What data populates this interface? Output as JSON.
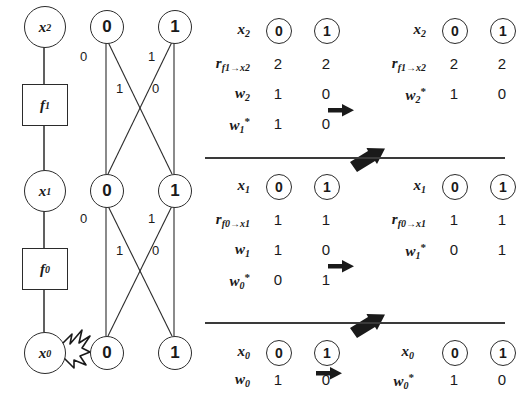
{
  "figure": {
    "factor_graph": {
      "nodes": [
        {
          "id": "x2",
          "type": "variable",
          "label": "x",
          "sub": "2"
        },
        {
          "id": "f1",
          "type": "factor",
          "label": "f",
          "sub": "1"
        },
        {
          "id": "x1",
          "type": "variable",
          "label": "x",
          "sub": "1"
        },
        {
          "id": "f0",
          "type": "factor",
          "label": "f",
          "sub": "0"
        },
        {
          "id": "x0",
          "type": "variable",
          "label": "x",
          "sub": "0"
        }
      ],
      "spark_icon": "spark-burst-icon"
    },
    "trellis": {
      "rows": [
        {
          "id": "top",
          "states": [
            "0",
            "1"
          ]
        },
        {
          "id": "middle",
          "states": [
            "0",
            "1"
          ]
        },
        {
          "id": "bottom",
          "states": [
            "0",
            "1"
          ]
        }
      ],
      "stages": [
        {
          "id": "stage-upper",
          "edge_labels": [
            {
              "id": "upper-left-vertical",
              "value": "0"
            },
            {
              "id": "upper-left-diagonal",
              "value": "1"
            },
            {
              "id": "upper-right-diagonal",
              "value": "1"
            },
            {
              "id": "upper-right-vertical",
              "value": "0"
            }
          ]
        },
        {
          "id": "stage-lower",
          "edge_labels": [
            {
              "id": "lower-left-vertical",
              "value": "0"
            },
            {
              "id": "lower-left-diagonal",
              "value": "1"
            },
            {
              "id": "lower-right-diagonal",
              "value": "1"
            },
            {
              "id": "lower-right-vertical",
              "value": "0"
            }
          ]
        }
      ]
    },
    "tables": {
      "column_headers": [
        "0",
        "1"
      ],
      "sections": [
        {
          "id": "section-x2",
          "left": {
            "id": "table-x2-left",
            "header": {
              "label": "x",
              "sub": "2",
              "sup": ""
            },
            "rows": [
              {
                "label": "r",
                "sub": "f1→x2",
                "sup": "",
                "values": [
                  "2",
                  "2"
                ]
              },
              {
                "label": "w",
                "sub": "2",
                "sup": "",
                "values": [
                  "1",
                  "0"
                ]
              },
              {
                "label": "w",
                "sub": "1",
                "sup": "*",
                "values": [
                  "1",
                  "0"
                ]
              }
            ]
          },
          "arrow": "right-arrow-icon",
          "right": {
            "id": "table-x2-right",
            "header": {
              "label": "x",
              "sub": "2",
              "sup": ""
            },
            "rows": [
              {
                "label": "r",
                "sub": "f1→x2",
                "sup": "",
                "values": [
                  "2",
                  "2"
                ]
              },
              {
                "label": "w",
                "sub": "2",
                "sup": "*",
                "values": [
                  "1",
                  "0"
                ]
              }
            ]
          }
        },
        {
          "id": "section-x1",
          "left": {
            "id": "table-x1-left",
            "header": {
              "label": "x",
              "sub": "1",
              "sup": ""
            },
            "rows": [
              {
                "label": "r",
                "sub": "f0→x1",
                "sup": "",
                "values": [
                  "1",
                  "1"
                ]
              },
              {
                "label": "w",
                "sub": "1",
                "sup": "",
                "values": [
                  "1",
                  "0"
                ]
              },
              {
                "label": "w",
                "sub": "0",
                "sup": "*",
                "values": [
                  "0",
                  "1"
                ]
              }
            ]
          },
          "arrow": "right-arrow-icon",
          "right": {
            "id": "table-x1-right",
            "header": {
              "label": "x",
              "sub": "1",
              "sup": ""
            },
            "rows": [
              {
                "label": "r",
                "sub": "f0→x1",
                "sup": "",
                "values": [
                  "1",
                  "1"
                ]
              },
              {
                "label": "w",
                "sub": "1",
                "sup": "*",
                "values": [
                  "0",
                  "1"
                ]
              }
            ]
          }
        },
        {
          "id": "section-x0",
          "left": {
            "id": "table-x0-left",
            "header": {
              "label": "x",
              "sub": "0",
              "sup": ""
            },
            "rows": [
              {
                "label": "w",
                "sub": "0",
                "sup": "",
                "values": [
                  "1",
                  "0"
                ]
              }
            ]
          },
          "arrow": "right-arrow-icon",
          "right": {
            "id": "table-x0-right",
            "header": {
              "label": "x",
              "sub": "0",
              "sup": ""
            },
            "rows": [
              {
                "label": "w",
                "sub": "0",
                "sup": "*",
                "values": [
                  "1",
                  "0"
                ]
              }
            ]
          }
        }
      ],
      "backtrack_arrows": [
        {
          "id": "backtrack-arrow-upper",
          "icon": "up-left-arrow-icon"
        },
        {
          "id": "backtrack-arrow-lower",
          "icon": "up-left-arrow-icon"
        }
      ]
    },
    "colors": {
      "ink": "#1a1a1a",
      "stroke": "#2b2b2b",
      "rule": "#3a3a3a",
      "background": "#ffffff"
    }
  }
}
